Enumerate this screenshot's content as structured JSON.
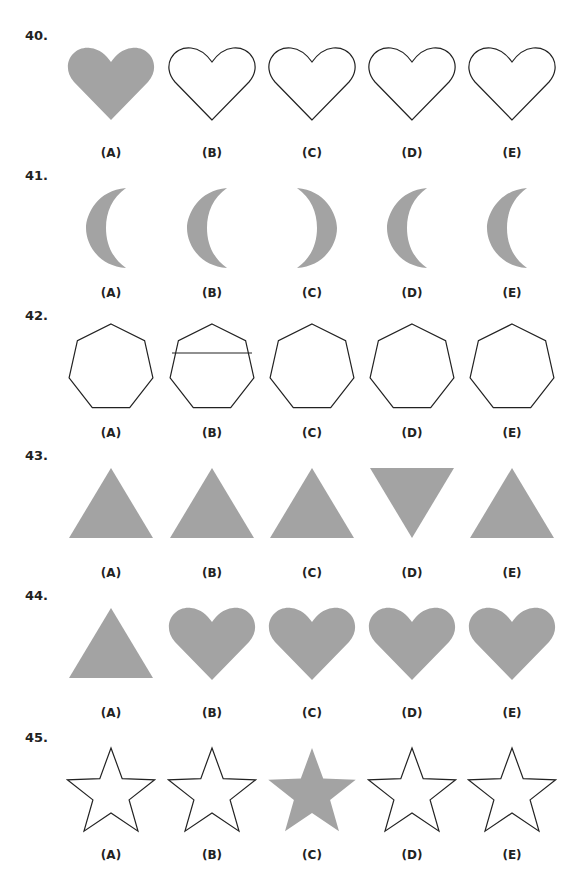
{
  "fill_color": "#a3a3a3",
  "stroke_color": "#222222",
  "option_labels": [
    "(A)",
    "(B)",
    "(C)",
    "(D)",
    "(E)"
  ],
  "questions": [
    {
      "number": "40.",
      "shapes": [
        {
          "type": "heart",
          "filled": true
        },
        {
          "type": "heart",
          "filled": false
        },
        {
          "type": "heart",
          "filled": false
        },
        {
          "type": "heart",
          "filled": false
        },
        {
          "type": "heart",
          "filled": false
        }
      ]
    },
    {
      "number": "41.",
      "shapes": [
        {
          "type": "crescent",
          "facing": "right",
          "filled": true
        },
        {
          "type": "crescent",
          "facing": "right",
          "filled": true
        },
        {
          "type": "crescent",
          "facing": "left",
          "filled": true
        },
        {
          "type": "crescent",
          "facing": "right",
          "filled": true
        },
        {
          "type": "crescent",
          "facing": "right",
          "filled": true
        }
      ]
    },
    {
      "number": "42.",
      "shapes": [
        {
          "type": "heptagon",
          "filled": false
        },
        {
          "type": "heptagon",
          "filled": false,
          "line": true
        },
        {
          "type": "heptagon",
          "filled": false
        },
        {
          "type": "heptagon",
          "filled": false
        },
        {
          "type": "heptagon",
          "filled": false
        }
      ]
    },
    {
      "number": "43.",
      "shapes": [
        {
          "type": "triangle-up",
          "filled": true
        },
        {
          "type": "triangle-up",
          "filled": true
        },
        {
          "type": "triangle-up",
          "filled": true
        },
        {
          "type": "triangle-down",
          "filled": true
        },
        {
          "type": "triangle-up",
          "filled": true
        }
      ]
    },
    {
      "number": "44.",
      "shapes": [
        {
          "type": "triangle-up",
          "filled": true
        },
        {
          "type": "heart",
          "filled": true
        },
        {
          "type": "heart",
          "filled": true
        },
        {
          "type": "heart",
          "filled": true
        },
        {
          "type": "heart",
          "filled": true
        }
      ]
    },
    {
      "number": "45.",
      "shapes": [
        {
          "type": "star",
          "filled": false
        },
        {
          "type": "star",
          "filled": false
        },
        {
          "type": "star",
          "filled": true
        },
        {
          "type": "star",
          "filled": false
        },
        {
          "type": "star",
          "filled": false
        }
      ]
    }
  ]
}
